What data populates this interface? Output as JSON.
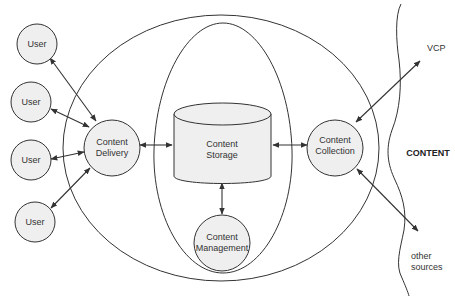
{
  "diagram": {
    "type": "content-system-architecture",
    "colors": {
      "stroke": "#333333",
      "node_fill": "#efefef",
      "background": "#ffffff"
    },
    "nodes": {
      "users": [
        {
          "label": "User"
        },
        {
          "label": "User"
        },
        {
          "label": "User"
        },
        {
          "label": "User"
        }
      ],
      "content_delivery": {
        "line1": "Content",
        "line2": "Delivery"
      },
      "content_storage": {
        "line1": "Content",
        "line2": "Storage"
      },
      "content_management": {
        "line1": "Content",
        "line2": "Management"
      },
      "content_collection": {
        "line1": "Content",
        "line2": "Collection"
      }
    },
    "external": {
      "region_label": "CONTENT",
      "vcp_label": "VCP",
      "other_sources_line1": "other",
      "other_sources_line2": "sources"
    },
    "edges": [
      {
        "from": "User 1",
        "to": "Content Delivery",
        "bidirectional": true
      },
      {
        "from": "User 2",
        "to": "Content Delivery",
        "bidirectional": true
      },
      {
        "from": "User 3",
        "to": "Content Delivery",
        "bidirectional": true
      },
      {
        "from": "User 4",
        "to": "Content Delivery",
        "bidirectional": true
      },
      {
        "from": "Content Delivery",
        "to": "Content Storage",
        "bidirectional": true
      },
      {
        "from": "Content Storage",
        "to": "Content Collection",
        "bidirectional": true
      },
      {
        "from": "Content Storage",
        "to": "Content Management",
        "bidirectional": true
      },
      {
        "from": "Content Collection",
        "to": "VCP",
        "bidirectional": true
      },
      {
        "from": "Content Collection",
        "to": "other sources",
        "bidirectional": true
      }
    ]
  }
}
